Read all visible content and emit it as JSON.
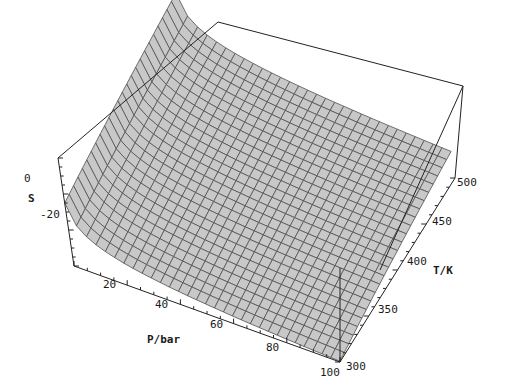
{
  "chart_data": {
    "type": "surface3d",
    "title": "",
    "xlabel": "P/bar",
    "ylabel": "T/K",
    "zlabel": "S",
    "x_ticks": [
      "20",
      "40",
      "60",
      "80",
      "100"
    ],
    "y_ticks": [
      "300",
      "350",
      "400",
      "450",
      "500"
    ],
    "z_ticks": [
      "0",
      "-20"
    ],
    "xlim": [
      1,
      100
    ],
    "ylim": [
      300,
      500
    ],
    "zlim": [
      -35,
      25
    ],
    "grid_x": 30,
    "grid_y": 25,
    "sample_points": [
      {
        "P": 1,
        "T": 500,
        "S": 20
      },
      {
        "P": 10,
        "T": 400,
        "S": 0
      },
      {
        "P": 20,
        "T": 300,
        "S": -18
      },
      {
        "P": 50,
        "T": 400,
        "S": -26
      },
      {
        "P": 100,
        "T": 300,
        "S": -32
      },
      {
        "P": 100,
        "T": 500,
        "S": -10
      }
    ],
    "surface_color": "#c8c8c8",
    "mesh_color": "#505050",
    "box_color": "#222222"
  },
  "labels": {
    "z_title": "S",
    "x_title": "P/bar",
    "y_title": "T/K"
  }
}
